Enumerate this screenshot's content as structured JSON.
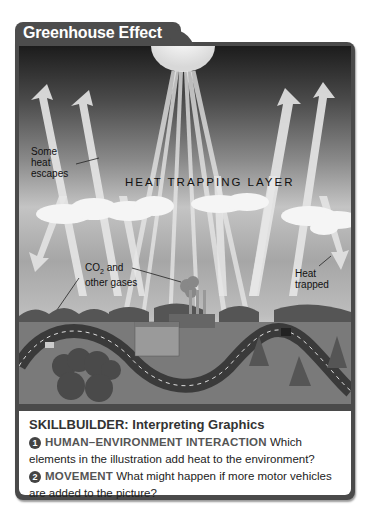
{
  "title": "Greenhouse Effect",
  "illustration": {
    "labels": {
      "some_heat_escapes": [
        "Some",
        "heat",
        "escapes"
      ],
      "heat_trapping_layer": "HEAT TRAPPING LAYER",
      "co2_main": "CO",
      "co2_sub": "2",
      "co2_rest": " and",
      "other_gases": "other gases",
      "heat_trapped": [
        "Heat",
        "trapped"
      ]
    },
    "icons": [
      "sun-icon",
      "heat-arrow-icon",
      "cloud-icon",
      "factory-icon",
      "road-icon",
      "tree-icon",
      "car-icon"
    ]
  },
  "skillbuilder": {
    "title": "SKILLBUILDER: Interpreting Graphics",
    "questions": [
      {
        "number": "1",
        "keyword": "HUMAN–ENVIRONMENT INTERACTION",
        "text": "Which elements in the illustration add heat to the environment?"
      },
      {
        "number": "2",
        "keyword": "MOVEMENT",
        "text": "What might happen if more motor vehicles are added to the picture?"
      }
    ]
  }
}
